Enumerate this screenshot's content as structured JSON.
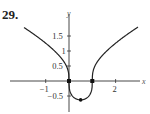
{
  "problem_number": "29.",
  "chart_data": {
    "type": "line",
    "title": "",
    "function": "y = cbrt(x^2 - x)",
    "xlabel": "x",
    "ylabel": "y",
    "xlim": [
      -1.95,
      2.95
    ],
    "ylim": [
      -0.8,
      1.95
    ],
    "x_ticks": [
      {
        "value": -1,
        "label": "−1"
      },
      {
        "value": 1,
        "label": ""
      },
      {
        "value": 2,
        "label": "2"
      }
    ],
    "y_ticks": [
      {
        "value": 1.5,
        "label": "1.5"
      },
      {
        "value": 1,
        "label": "1"
      },
      {
        "value": 0.5,
        "label": "0.5"
      },
      {
        "value": -0.5,
        "label": "−0.5"
      }
    ],
    "grid": false,
    "marked_points": [
      {
        "x": 0,
        "y": 0
      },
      {
        "x": 1,
        "y": 0
      },
      {
        "x": 0.5,
        "y": -0.63
      }
    ],
    "series": [
      {
        "name": "f(x)",
        "x": [
          -1.93,
          -1.5,
          -1,
          -0.5,
          -0.2,
          -0.05,
          0,
          0.05,
          0.2,
          0.5,
          0.8,
          0.95,
          1,
          1.05,
          1.2,
          1.5,
          2,
          2.5,
          2.96
        ],
        "values": [
          1.81,
          1.55,
          1.26,
          0.91,
          0.62,
          0.37,
          0,
          -0.36,
          -0.54,
          -0.63,
          -0.54,
          -0.36,
          0,
          0.37,
          0.62,
          0.91,
          1.26,
          1.55,
          1.81
        ]
      }
    ],
    "colors": {
      "curve": "#222222",
      "axis": "#333333"
    }
  }
}
